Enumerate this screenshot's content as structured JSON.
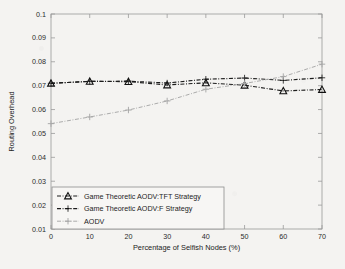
{
  "chart_data": {
    "type": "line",
    "title": "",
    "xlabel": "Percentage of Selfish Nodes (%)",
    "ylabel": "Routing Overhead",
    "x": [
      0,
      10,
      20,
      30,
      40,
      50,
      60,
      70
    ],
    "xlim": [
      0,
      70
    ],
    "ylim": [
      0.01,
      0.1
    ],
    "xticks": [
      "0",
      "10",
      "20",
      "30",
      "40",
      "50",
      "60",
      "70"
    ],
    "yticks": [
      "0.01",
      "0.02",
      "0.03",
      "0.04",
      "0.05",
      "0.06",
      "0.07",
      "0.08",
      "0.09",
      "0.1"
    ],
    "grid": false,
    "legend_position": "lower-left",
    "series": [
      {
        "name": "Game Theoretic AODV:TFT Strategy",
        "marker": "triangle",
        "color": "#1c1c1c",
        "linestyle": "dash-dot",
        "values": [
          0.071,
          0.0718,
          0.0717,
          0.0703,
          0.0712,
          0.0702,
          0.0678,
          0.0684
        ]
      },
      {
        "name": "Game Theoretic AODV:F Strategy",
        "marker": "plus-filled",
        "color": "#1c1c1c",
        "linestyle": "dash-dot",
        "values": [
          0.071,
          0.0718,
          0.0719,
          0.0711,
          0.0727,
          0.0732,
          0.0722,
          0.0733
        ]
      },
      {
        "name": "AODV",
        "marker": "plus",
        "color": "#a6a6a6",
        "linestyle": "dash-dot",
        "values": [
          0.0541,
          0.0569,
          0.0598,
          0.0636,
          0.0685,
          0.0709,
          0.0738,
          0.079
        ]
      }
    ]
  },
  "axes": {
    "x_title": "Percentage of Selfish Nodes (%)",
    "y_title": "Routing Overhead"
  },
  "legend": {
    "entries": [
      {
        "label": "Game Theoretic AODV:TFT Strategy"
      },
      {
        "label": "Game Theoretic AODV:F Strategy"
      },
      {
        "label": "AODV"
      }
    ]
  }
}
